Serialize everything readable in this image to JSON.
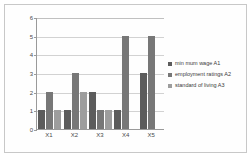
{
  "chart_data": {
    "type": "bar",
    "title": "",
    "xlabel": "",
    "ylabel": "",
    "categories": [
      "X1",
      "X2",
      "X3",
      "X4",
      "X5"
    ],
    "ylim": [
      0,
      6
    ],
    "yticks": [
      0,
      1,
      2,
      3,
      4,
      5,
      6
    ],
    "grid": true,
    "legend_position": "right",
    "series": [
      {
        "name": "min mum wage A1",
        "color": "#5c5c5c",
        "values": [
          1,
          1,
          2,
          1,
          3
        ]
      },
      {
        "name": "employment ratings A2",
        "color": "#777777",
        "values": [
          2,
          3,
          1,
          5,
          5
        ]
      },
      {
        "name": "standard of living A3",
        "color": "#9d9d9d",
        "values": [
          1,
          2,
          1,
          0,
          0
        ]
      }
    ]
  },
  "axis": {
    "y_tick_labels": [
      "6",
      "5",
      "4",
      "3",
      "2",
      "1",
      "0"
    ],
    "x_tick_labels": [
      "X1",
      "X2",
      "X3",
      "X4",
      "X5"
    ]
  },
  "legend": {
    "items": [
      {
        "label": "min mum wage A1"
      },
      {
        "label": "employment ratings A2"
      },
      {
        "label": "standard of living A3"
      }
    ]
  },
  "colors": {
    "series_1": "#5c5c5c",
    "series_2": "#777777",
    "series_3": "#9d9d9d",
    "axis": "#9a9a9a",
    "grid": "#d2d2d2",
    "background": "#ffffff",
    "border": "#c8c8c8"
  }
}
